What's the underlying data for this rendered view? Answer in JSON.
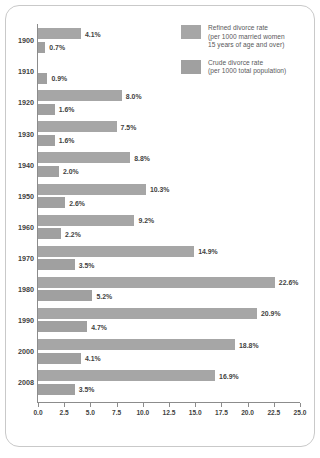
{
  "chart_data": {
    "type": "bar",
    "orientation": "horizontal",
    "title": "",
    "xlabel": "",
    "ylabel": "",
    "xlim": [
      0.0,
      25.0
    ],
    "xticks": [
      "0.0",
      "2.5",
      "5.0",
      "7.5",
      "10.0",
      "12.5",
      "15.0",
      "17.5",
      "20.0",
      "22.5",
      "25.0"
    ],
    "xtick_values": [
      0.0,
      2.5,
      5.0,
      7.5,
      10.0,
      12.5,
      15.0,
      17.5,
      20.0,
      22.5,
      25.0
    ],
    "grid": false,
    "legend_position": "top-right",
    "categories": [
      "1900",
      "1910",
      "1920",
      "1930",
      "1940",
      "1950",
      "1960",
      "1970",
      "1980",
      "1990",
      "2000",
      "2008"
    ],
    "series": [
      {
        "name": "Refined divorce rate",
        "values": [
          4.1,
          null,
          8.0,
          7.5,
          8.8,
          10.3,
          9.2,
          14.9,
          22.6,
          20.9,
          18.8,
          16.9
        ],
        "labels": [
          "4.1%",
          "",
          "8.0%",
          "7.5%",
          "8.8%",
          "10.3%",
          "9.2%",
          "14.9%",
          "22.6%",
          "20.9%",
          "18.8%",
          "16.9%"
        ],
        "color": "#a6a6a6"
      },
      {
        "name": "Crude divorce rate",
        "values": [
          0.7,
          0.9,
          1.6,
          1.6,
          2.0,
          2.6,
          2.2,
          3.5,
          5.2,
          4.7,
          4.1,
          3.5
        ],
        "labels": [
          "0.7%",
          "0.9%",
          "1.6%",
          "1.6%",
          "2.0%",
          "2.6%",
          "2.2%",
          "3.5%",
          "5.2%",
          "4.7%",
          "4.1%",
          "3.5%"
        ],
        "color": "#a0a0a0"
      }
    ]
  },
  "legend": {
    "items": [
      {
        "swatch_color": "#a6a6a6",
        "lines": [
          "Refined divorce rate",
          "(per 1000 married women",
          "15 years of age and over)"
        ]
      },
      {
        "swatch_color": "#a0a0a0",
        "lines": [
          "Crude divorce rate",
          "(per 1000 total population)"
        ]
      }
    ]
  }
}
